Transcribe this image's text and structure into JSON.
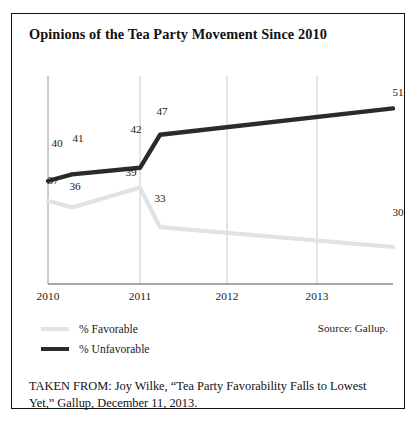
{
  "figure": {
    "title": "Opinions of the Tea Party Movement Since 2010",
    "source_note": "Source: Gallup.",
    "caption": "TAKEN FROM: Joy Wilke, “Tea Party Favorability Falls to Lowest Yet,” Gallup, December 11, 2013."
  },
  "legend": {
    "items": [
      {
        "label": "% Favorable",
        "color": "#e2e2e2"
      },
      {
        "label": "% Unfavorable",
        "color": "#2b2b2b"
      }
    ]
  },
  "colors": {
    "favorable": "#e2e2e2",
    "unfavorable": "#2b2b2b",
    "gridline": "#c9c9c9",
    "axis": "#8a8a8a",
    "frame": "#111111"
  },
  "chart_data": {
    "type": "line",
    "title": "Opinions of the Tea Party Movement Since 2010",
    "xlabel": "",
    "ylabel": "",
    "grid": "vertical-only",
    "legend_position": "bottom-left",
    "x": [
      0,
      1,
      2,
      3,
      4
    ],
    "categories": [
      "2010",
      "2011",
      "2012",
      "2013",
      ""
    ],
    "tick_labels": [
      "2010",
      "2011",
      "2012",
      "2013"
    ],
    "xlim": [
      0,
      4
    ],
    "ylim": [
      25,
      55
    ],
    "series": [
      {
        "name": "% Unfavorable",
        "color": "#2b2b2b",
        "values": [
          40,
          41,
          42,
          47,
          51
        ],
        "point_labels": [
          "40",
          "41",
          "42",
          "47",
          "51"
        ],
        "label_positions": [
          "above",
          "above",
          "above",
          "above",
          "above"
        ]
      },
      {
        "name": "% Favorable",
        "color": "#e2e2e2",
        "values": [
          37,
          36,
          39,
          33,
          30
        ],
        "point_labels": [
          "37",
          "36",
          "39",
          "33",
          "30"
        ],
        "label_positions": [
          "below",
          "below",
          "below",
          "below",
          "below"
        ]
      }
    ],
    "annotations": [
      "Source: Gallup."
    ]
  },
  "axis": {
    "ticks": [
      {
        "label": "2010",
        "x": 36
      },
      {
        "label": "2011",
        "x": 128
      },
      {
        "label": "2012",
        "x": 215
      },
      {
        "label": "2013",
        "x": 305
      }
    ]
  },
  "labels": {
    "unfavorable": [
      {
        "text": "40",
        "x": 45,
        "y": 123
      },
      {
        "text": "41",
        "x": 66,
        "y": 119
      },
      {
        "text": "42",
        "x": 125,
        "y": 110
      },
      {
        "text": "47",
        "x": 150,
        "y": 95
      },
      {
        "text": "51",
        "x": 390,
        "y": 80
      }
    ],
    "favorable": [
      {
        "text": "37",
        "x": 41,
        "y": 160
      },
      {
        "text": "36",
        "x": 63,
        "y": 166
      },
      {
        "text": "39",
        "x": 119,
        "y": 152
      },
      {
        "text": "33",
        "x": 148,
        "y": 178
      },
      {
        "text": "30",
        "x": 390,
        "y": 192
      }
    ]
  }
}
